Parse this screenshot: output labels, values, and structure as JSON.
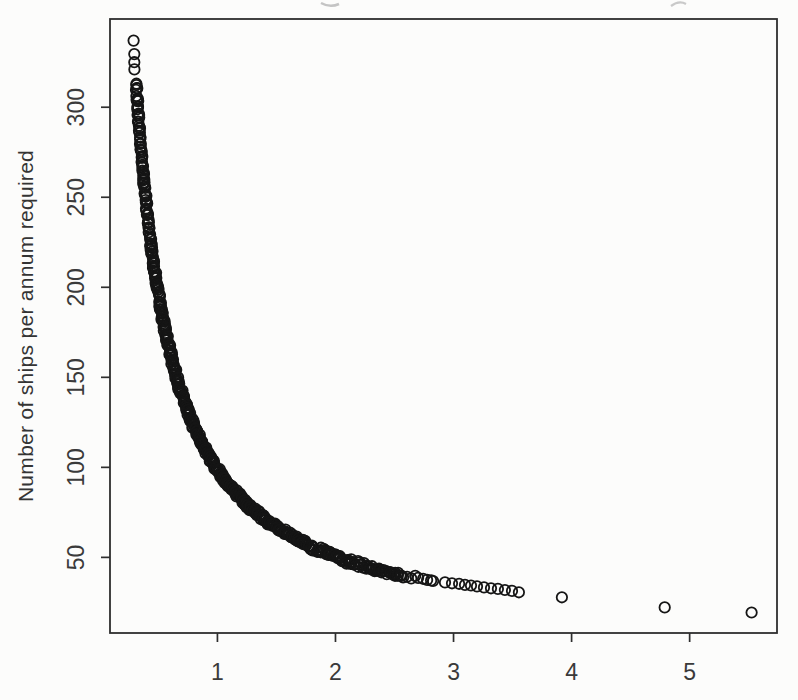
{
  "figure": {
    "background_color": "#fcfcfb",
    "artifact_note": "faint fragments of a cropped text line along the top edge of the scan"
  },
  "axes": {
    "box_color": "#2e2e2e",
    "tick_color": "#2e2e2e",
    "tick_label_color": "#3a3a3a",
    "marker_color": "#151515"
  },
  "chart_data": {
    "type": "scatter",
    "title": "",
    "xlabel": "",
    "ylabel": "Number of ships per annum required",
    "x_ticks": [
      1,
      2,
      3,
      4,
      5
    ],
    "y_ticks": [
      50,
      100,
      150,
      200,
      250,
      300
    ],
    "xlim": [
      0.09,
      5.74
    ],
    "ylim": [
      8,
      349
    ],
    "grid": false,
    "legend": null,
    "marker": "open-circle",
    "relation": "y ≈ 97/x + 2 (ships per annum inversely proportional to x)",
    "dense_band": {
      "model": "y = 97/x + 2",
      "x_min": 0.312,
      "x_max": 2.56,
      "count": 560,
      "jitter_y": 1.4,
      "jitter_x": 0.02
    },
    "points_top": [
      [
        0.29,
        337.0
      ],
      [
        0.296,
        329.5
      ],
      [
        0.296,
        325.0
      ],
      [
        0.297,
        321.0
      ]
    ],
    "points_mid": [
      [
        2.573,
        38.9
      ],
      [
        2.607,
        39.2
      ],
      [
        2.641,
        38.3
      ],
      [
        2.675,
        39.7
      ],
      [
        2.7,
        38.6
      ],
      [
        2.742,
        38.1
      ],
      [
        2.776,
        37.5
      ],
      [
        2.81,
        37.2
      ],
      [
        2.827,
        36.9
      ]
    ],
    "points_tail": [
      [
        2.928,
        36.1
      ],
      [
        2.987,
        35.6
      ],
      [
        3.047,
        35.3
      ],
      [
        3.097,
        34.7
      ],
      [
        3.148,
        34.4
      ],
      [
        3.199,
        33.9
      ],
      [
        3.258,
        33.3
      ],
      [
        3.317,
        32.8
      ],
      [
        3.376,
        32.5
      ],
      [
        3.435,
        31.9
      ],
      [
        3.495,
        31.4
      ],
      [
        3.554,
        30.6
      ]
    ],
    "points_outliers": [
      [
        3.918,
        27.8
      ],
      [
        4.789,
        22.2
      ],
      [
        5.525,
        19.4
      ]
    ]
  }
}
